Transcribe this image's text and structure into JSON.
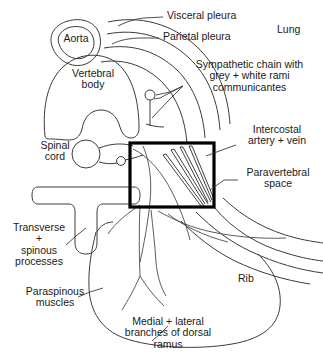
{
  "figure": {
    "type": "anatomical-line-diagram",
    "background_color": "#ffffff",
    "line_color": "#3b3b3b",
    "roi_box_color": "#000000"
  },
  "labels": {
    "visceral_pleura": "Visceral pleura",
    "parietal_pleura": "Parietal pleura",
    "lung": "Lung",
    "aorta": "Aorta",
    "vertebral_body": "Vertebral\nbody",
    "sympathetic_chain": "Sympathetic chain with\ngrey + white rami\ncommunicantes",
    "spinal_cord": "Spinal\ncord",
    "intercostal_vessels": "Intercostal\nartery + vein",
    "paravertebral_space": "Paravertebral\nspace",
    "transverse_spinous": "Transverse\n+\nspinous\nprocesses",
    "paraspinous_muscles": "Paraspinous\nmuscles",
    "rib": "Rib",
    "dorsal_ramus": "Medial + lateral\nbranches of dorsal\nramus"
  }
}
